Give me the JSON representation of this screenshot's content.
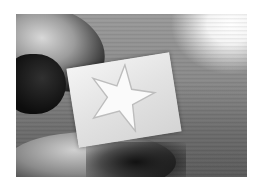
{
  "image": {
    "description": "Grayscale photograph of a hand holding a translucent rectangular block with a star-shaped impression, against a wood-grain background with bright light in the upper right",
    "colors": {
      "background": "#ffffff",
      "block": "#e6e6e6",
      "star": "#f8f8f8",
      "shadow": "#101010"
    }
  }
}
